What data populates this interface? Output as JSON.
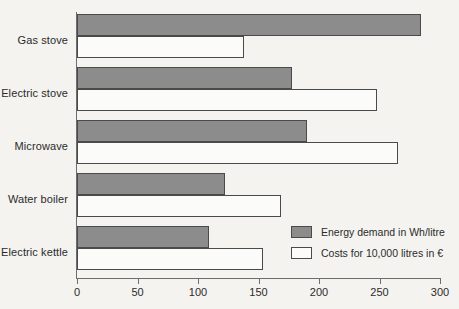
{
  "chart_data": {
    "type": "bar",
    "orientation": "horizontal",
    "title": "",
    "xlabel": "",
    "ylabel": "",
    "xlim": [
      0,
      300
    ],
    "xticks": [
      0,
      50,
      100,
      150,
      200,
      250,
      300
    ],
    "xtick_labels": [
      "0",
      "50",
      "100",
      "150",
      "200",
      "250",
      "300"
    ],
    "grid": false,
    "legend_position": "inside-bottom-right",
    "categories": [
      "Gas stove",
      "Electric stove",
      "Microwave",
      "Water boiler",
      "Electric kettle"
    ],
    "series": [
      {
        "name": "Energy demand in Wh/litre",
        "color": "#8c8c8c",
        "values": [
          284,
          178,
          190,
          122,
          109
        ]
      },
      {
        "name": "Costs for 10,000 litres in €",
        "color": "#fbfbf9",
        "values": [
          138,
          248,
          265,
          169,
          154
        ]
      }
    ]
  },
  "axis": {
    "ticks": [
      "0",
      "50",
      "100",
      "150",
      "200",
      "250",
      "300"
    ]
  },
  "categories": [
    {
      "label": "Gas stove"
    },
    {
      "label": "Electric stove"
    },
    {
      "label": "Microwave"
    },
    {
      "label": "Water boiler"
    },
    {
      "label": "Electric kettle"
    }
  ],
  "legend": {
    "items": [
      {
        "label": "Energy demand in Wh/litre",
        "swatch": "gray-filled-swatch"
      },
      {
        "label": "Costs for 10,000 litres in €",
        "swatch": "white-outlined-swatch"
      }
    ]
  },
  "colors": {
    "energy_fill": "#8c8c8c",
    "costs_fill": "#fbfbf9",
    "bar_stroke": "#4a4a4a",
    "axis": "#6d6d6d",
    "background": "#f4f3f0",
    "text": "#2b2b2b"
  }
}
